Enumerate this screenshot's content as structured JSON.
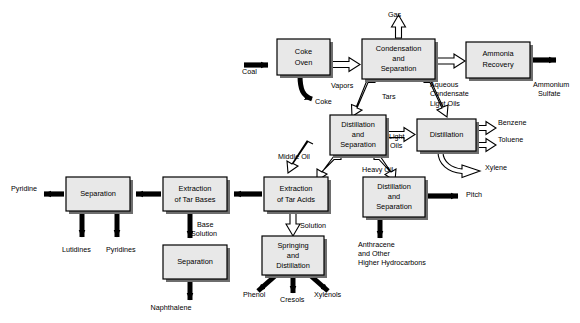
{
  "diagram": {
    "colors": {
      "box_fill": "#e8e8e8",
      "box_stroke": "#000000",
      "shadow": "#6e6e6e",
      "background": "#ffffff",
      "solid_arrow": "#000000",
      "hollow_arrow_fill": "#ffffff"
    },
    "boxes": [
      {
        "id": "coke-oven",
        "label_lines": [
          "Coke",
          "Oven"
        ],
        "x": 277,
        "y": 39,
        "w": 53,
        "h": 36
      },
      {
        "id": "condensation-and-separation",
        "label_lines": [
          "Condensation",
          "and",
          "Separation"
        ],
        "x": 362,
        "y": 39,
        "w": 73,
        "h": 40
      },
      {
        "id": "ammonia-recovery",
        "label_lines": [
          "Ammonia",
          "Recovery"
        ],
        "x": 466,
        "y": 42,
        "w": 64,
        "h": 36
      },
      {
        "id": "distillation-and-separation-top",
        "label_lines": [
          "Distillation",
          "and",
          "Separation"
        ],
        "x": 330,
        "y": 115,
        "w": 56,
        "h": 40
      },
      {
        "id": "distillation",
        "label_lines": [
          "Distillation"
        ],
        "x": 417,
        "y": 119,
        "w": 59,
        "h": 32
      },
      {
        "id": "distillation-and-separation-bottom",
        "label_lines": [
          "Distillation",
          "and",
          "Separation"
        ],
        "x": 363,
        "y": 177,
        "w": 62,
        "h": 40
      },
      {
        "id": "extraction-of-tar-acids",
        "label_lines": [
          "Extraction",
          "of Tar Acids"
        ],
        "x": 264,
        "y": 177,
        "w": 64,
        "h": 34
      },
      {
        "id": "extraction-of-tar-bases",
        "label_lines": [
          "Extraction",
          "of Tar Bases"
        ],
        "x": 163,
        "y": 177,
        "w": 64,
        "h": 34
      },
      {
        "id": "separation-tar-bases",
        "label_lines": [
          "Separation"
        ],
        "x": 66,
        "y": 177,
        "w": 64,
        "h": 34
      },
      {
        "id": "separation-naphthalene",
        "label_lines": [
          "Separation"
        ],
        "x": 163,
        "y": 245,
        "w": 64,
        "h": 34
      },
      {
        "id": "springing-and-distillation",
        "label_lines": [
          "Springing",
          "and",
          "Distillation"
        ],
        "x": 262,
        "y": 236,
        "w": 62,
        "h": 39
      }
    ],
    "stream_labels": [
      {
        "id": "coal",
        "text": "Coal",
        "x": 242,
        "y": 74,
        "anchor": "start"
      },
      {
        "id": "coke",
        "text": "Coke",
        "x": 315,
        "y": 104,
        "anchor": "start"
      },
      {
        "id": "vapors",
        "text": "Vapors",
        "x": 331,
        "y": 88,
        "anchor": "start"
      },
      {
        "id": "gas",
        "text": "Gas",
        "x": 388,
        "y": 17,
        "anchor": "start"
      },
      {
        "id": "aqueous-condensate",
        "text": "Aqueous",
        "x": 430,
        "y": 87,
        "anchor": "start"
      },
      {
        "id": "condensate",
        "text": "Condensate",
        "x": 430,
        "y": 96,
        "anchor": "start"
      },
      {
        "id": "ammonium",
        "text": "Ammonium",
        "x": 533,
        "y": 87,
        "anchor": "start"
      },
      {
        "id": "sulfate",
        "text": "Sulfate",
        "x": 538,
        "y": 96,
        "anchor": "start"
      },
      {
        "id": "tars",
        "text": "Tars",
        "x": 382,
        "y": 99,
        "anchor": "start"
      },
      {
        "id": "light-oils-upper",
        "text": "Light Oils",
        "x": 430,
        "y": 106,
        "anchor": "start"
      },
      {
        "id": "light-oils-mid-1",
        "text": "Light",
        "x": 389,
        "y": 139,
        "anchor": "start"
      },
      {
        "id": "light-oils-mid-2",
        "text": "Oils",
        "x": 390,
        "y": 148,
        "anchor": "start"
      },
      {
        "id": "benzene",
        "text": "Benzene",
        "x": 498,
        "y": 125,
        "anchor": "start"
      },
      {
        "id": "toluene",
        "text": "Toluene",
        "x": 498,
        "y": 142,
        "anchor": "start"
      },
      {
        "id": "xylene",
        "text": "Xylene",
        "x": 485,
        "y": 170,
        "anchor": "start"
      },
      {
        "id": "middle-oil",
        "text": "Middle Oil",
        "x": 278,
        "y": 159,
        "anchor": "start"
      },
      {
        "id": "heavy-oil",
        "text": "Heavy Oil",
        "x": 362,
        "y": 172,
        "anchor": "start"
      },
      {
        "id": "pitch",
        "text": "Pitch",
        "x": 466,
        "y": 197,
        "anchor": "start"
      },
      {
        "id": "pyridine",
        "text": "Pyridine",
        "x": 11,
        "y": 191,
        "anchor": "start"
      },
      {
        "id": "lutidines",
        "text": "Lutidines",
        "x": 62,
        "y": 252,
        "anchor": "start"
      },
      {
        "id": "pyridines",
        "text": "Pyridines",
        "x": 106,
        "y": 252,
        "anchor": "start"
      },
      {
        "id": "base-solution-1",
        "text": "Base",
        "x": 197,
        "y": 227,
        "anchor": "start"
      },
      {
        "id": "base-solution-2",
        "text": "Solution",
        "x": 191,
        "y": 236,
        "anchor": "start"
      },
      {
        "id": "solution",
        "text": "Solution",
        "x": 300,
        "y": 228,
        "anchor": "start"
      },
      {
        "id": "naphthalene",
        "text": "Naphthalene",
        "x": 171,
        "y": 310,
        "anchor": "middle"
      },
      {
        "id": "phenol",
        "text": "Phenol",
        "x": 243,
        "y": 297,
        "anchor": "start"
      },
      {
        "id": "cresols",
        "text": "Cresols",
        "x": 280,
        "y": 302,
        "anchor": "start"
      },
      {
        "id": "xylenols",
        "text": "Xylenols",
        "x": 314,
        "y": 297,
        "anchor": "start"
      },
      {
        "id": "anthracene-1",
        "text": "Anthracene",
        "x": 358,
        "y": 247,
        "anchor": "start"
      },
      {
        "id": "anthracene-2",
        "text": "and Other",
        "x": 358,
        "y": 256,
        "anchor": "start"
      },
      {
        "id": "anthracene-3",
        "text": "Higher Hydrocarbons",
        "x": 358,
        "y": 265,
        "anchor": "start"
      }
    ]
  }
}
